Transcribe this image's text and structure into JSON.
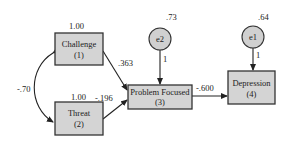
{
  "diagram": {
    "type": "path-diagram",
    "nodes": [
      {
        "id": "challenge",
        "label": "Challenge",
        "index": "(1)",
        "shape": "rect",
        "variance": "1.00"
      },
      {
        "id": "threat",
        "label": "Threat",
        "index": "(2)",
        "shape": "rect",
        "variance": "1.00"
      },
      {
        "id": "problem_focused",
        "label": "Problem Focused",
        "index": "(3)",
        "shape": "rect"
      },
      {
        "id": "depression",
        "label": "Depression",
        "index": "(4)",
        "shape": "rect"
      },
      {
        "id": "e2",
        "label": "e2",
        "shape": "circle",
        "variance": ".73"
      },
      {
        "id": "e1",
        "label": "e1",
        "shape": "circle",
        "variance": ".64"
      }
    ],
    "edges": [
      {
        "from": "challenge",
        "to": "problem_focused",
        "coefficient": ".363",
        "type": "path"
      },
      {
        "from": "threat",
        "to": "problem_focused",
        "coefficient": "-.196",
        "type": "path"
      },
      {
        "from": "problem_focused",
        "to": "depression",
        "coefficient": "-.600",
        "type": "path"
      },
      {
        "from": "e2",
        "to": "problem_focused",
        "coefficient": "1",
        "type": "error"
      },
      {
        "from": "e1",
        "to": "depression",
        "coefficient": "1",
        "type": "error"
      },
      {
        "from": "challenge",
        "to": "threat",
        "coefficient": "-.70",
        "type": "covariance"
      }
    ]
  },
  "labels": {
    "challenge": "Challenge",
    "challenge_idx": "(1)",
    "challenge_var": "1.00",
    "threat": "Threat",
    "threat_idx": "(2)",
    "threat_var": "1.00",
    "pf": "Problem Focused",
    "pf_idx": "(3)",
    "dep": "Depression",
    "dep_idx": "(4)",
    "e2": "e2",
    "e2_var": ".73",
    "e1": "e1",
    "e1_var": ".64",
    "coef_challenge_pf": ".363",
    "coef_threat_pf": "-.196",
    "coef_pf_dep": "-.600",
    "coef_e2": "1",
    "coef_e1": "1",
    "cov_challenge_threat": "-.70"
  }
}
